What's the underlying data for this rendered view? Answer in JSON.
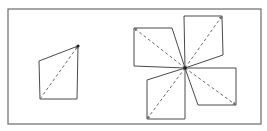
{
  "diagram": {
    "frame": {
      "x": 8,
      "y": 9,
      "width": 253,
      "height": 115,
      "stroke": "#6a6a6a"
    },
    "left_figure": {
      "label": "single-quadrilateral",
      "polygon": [
        [
          39,
          61
        ],
        [
          78,
          46
        ],
        [
          77,
          99
        ],
        [
          40,
          99
        ]
      ],
      "diagonal": {
        "from": [
          40,
          99
        ],
        "to": [
          78,
          46
        ]
      },
      "vertex_dot": [
        78,
        46
      ]
    },
    "right_figure": {
      "label": "four-quadrilateral-pinwheel",
      "center": [
        185,
        68
      ],
      "petals": [
        {
          "name": "top-left",
          "polygon": [
            [
              134,
              28
            ],
            [
              172,
              28
            ],
            [
              185,
              68
            ],
            [
              134,
              66
            ]
          ],
          "diagonal": {
            "from": [
              185,
              68
            ],
            "to": [
              134,
              28
            ]
          }
        },
        {
          "name": "top-right",
          "polygon": [
            [
              184,
              16
            ],
            [
              222,
              16
            ],
            [
              223,
              55
            ],
            [
              185,
              68
            ]
          ],
          "diagonal": {
            "from": [
              185,
              68
            ],
            "to": [
              222,
              16
            ]
          }
        },
        {
          "name": "bottom-left",
          "polygon": [
            [
              185,
              68
            ],
            [
              147,
              80
            ],
            [
              147,
              119
            ],
            [
              185,
              119
            ]
          ],
          "diagonal": {
            "from": [
              185,
              68
            ],
            "to": [
              147,
              119
            ]
          }
        },
        {
          "name": "bottom-right",
          "polygon": [
            [
              185,
              68
            ],
            [
              236,
              68
            ],
            [
              236,
              105
            ],
            [
              198,
              105
            ]
          ],
          "diagonal": {
            "from": [
              185,
              68
            ],
            "to": [
              236,
              105
            ]
          }
        }
      ]
    },
    "colors": {
      "edge": "#4a4a4a",
      "diagonal": "#6a6a6a",
      "dot": "#222222",
      "background": "#ffffff"
    }
  }
}
